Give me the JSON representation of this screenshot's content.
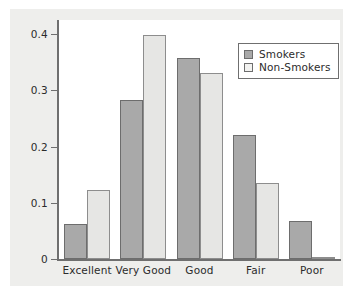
{
  "chart_data": {
    "type": "bar",
    "title": "",
    "xlabel": "",
    "ylabel": "",
    "categories": [
      "Excellent",
      "Very Good",
      "Good",
      "Fair",
      "Poor"
    ],
    "series": [
      {
        "name": "Smokers",
        "color": "#a9a9a9",
        "values": [
          0.062,
          0.283,
          0.357,
          0.22,
          0.068
        ]
      },
      {
        "name": "Non-Smokers",
        "color": "#e6e6e4",
        "values": [
          0.122,
          0.398,
          0.331,
          0.135,
          0.002
        ]
      }
    ],
    "ylim": [
      0,
      0.425
    ],
    "ytick_labels": [
      "0.4",
      "0.3",
      "0.2",
      "0.1",
      "0"
    ],
    "ytick_values": [
      0.4,
      0.3,
      0.2,
      0.1,
      0
    ],
    "grid": false,
    "legend_position": "top-right",
    "legend_entries": [
      "Smokers",
      "Non-Smokers"
    ]
  },
  "figure": {
    "background_color": "#eeeeec",
    "plot_background_color": "#ffffff",
    "axis_color": "#6f6f6f"
  }
}
